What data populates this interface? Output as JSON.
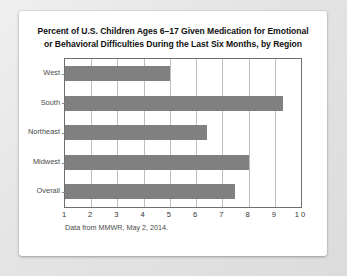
{
  "chart_data": {
    "type": "bar",
    "orientation": "horizontal",
    "title": "Percent of U.S. Children Ages 6–17 Given Medication for Emotional or Behavioral Difficulties During the Last Six Months, by Region",
    "title_line1": "Percent of U.S. Children Ages 6–17 Given Medication for Emotional",
    "title_line2": "or Behavioral Difficulties During the Last Six Months, by Region",
    "categories": [
      "West",
      "South",
      "Northeast",
      "Midwest",
      "Overall"
    ],
    "values": [
      5.0,
      9.3,
      6.4,
      8.0,
      7.5
    ],
    "xlabel": "",
    "ylabel": "",
    "xlim": [
      1,
      10
    ],
    "xticks": [
      "1",
      "2",
      "3",
      "4",
      "5",
      "6",
      "7",
      "8",
      "9",
      "1 0"
    ],
    "xtick_values": [
      1,
      2,
      3,
      4,
      5,
      6,
      7,
      8,
      9,
      10
    ],
    "grid": "vertical",
    "legend": "none",
    "bar_color": "#808080",
    "frame_color": "#6e6e6e",
    "gridline_color": "#bdbdbd",
    "background": "#ffffff",
    "annotation": "Data from MMWR, May 2, 2014."
  },
  "card": {
    "source_note": "Data from MMWR, May 2, 2014."
  }
}
